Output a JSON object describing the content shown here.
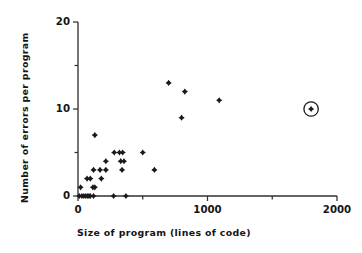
{
  "chart_data": {
    "type": "scatter",
    "title": "",
    "xlabel": "Size of program (lines of code)",
    "ylabel": "Number of errors per program",
    "xlim": [
      0,
      2000
    ],
    "ylim": [
      0,
      20
    ],
    "xticks": [
      0,
      500,
      1000,
      1500,
      2000
    ],
    "xtick_labels": [
      "0",
      "",
      "1000",
      "",
      "2000"
    ],
    "yticks": [
      0,
      5,
      10,
      15,
      20
    ],
    "ytick_labels": [
      "0",
      "",
      "10",
      "",
      "20"
    ],
    "grid": false,
    "legend": null,
    "marker": "diamond",
    "marker_color": "#1a1a1a",
    "points": [
      {
        "x": 10,
        "y": 0
      },
      {
        "x": 20,
        "y": 1
      },
      {
        "x": 30,
        "y": 0
      },
      {
        "x": 45,
        "y": 0
      },
      {
        "x": 60,
        "y": 0
      },
      {
        "x": 75,
        "y": 0
      },
      {
        "x": 85,
        "y": 0
      },
      {
        "x": 95,
        "y": 0
      },
      {
        "x": 70,
        "y": 2
      },
      {
        "x": 95,
        "y": 2
      },
      {
        "x": 115,
        "y": 1
      },
      {
        "x": 130,
        "y": 1
      },
      {
        "x": 120,
        "y": 0
      },
      {
        "x": 130,
        "y": 7
      },
      {
        "x": 120,
        "y": 3
      },
      {
        "x": 170,
        "y": 3
      },
      {
        "x": 180,
        "y": 2
      },
      {
        "x": 215,
        "y": 3
      },
      {
        "x": 215,
        "y": 4
      },
      {
        "x": 275,
        "y": 0
      },
      {
        "x": 280,
        "y": 5
      },
      {
        "x": 320,
        "y": 5
      },
      {
        "x": 345,
        "y": 5
      },
      {
        "x": 330,
        "y": 4
      },
      {
        "x": 355,
        "y": 4
      },
      {
        "x": 340,
        "y": 3
      },
      {
        "x": 370,
        "y": 0
      },
      {
        "x": 500,
        "y": 5
      },
      {
        "x": 590,
        "y": 3
      },
      {
        "x": 700,
        "y": 13
      },
      {
        "x": 800,
        "y": 9
      },
      {
        "x": 825,
        "y": 12
      },
      {
        "x": 1090,
        "y": 11
      }
    ],
    "highlighted_points": [
      {
        "x": 1800,
        "y": 10,
        "annotation": "circled-outlier"
      }
    ]
  }
}
